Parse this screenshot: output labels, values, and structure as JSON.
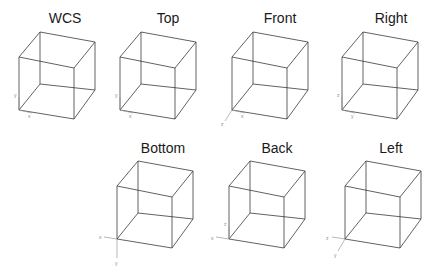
{
  "views": [
    {
      "id": "wcs",
      "label": "WCS",
      "label_x": 65,
      "label_y": 10,
      "origin": [
        19,
        110
      ],
      "dx": 0,
      "dy": 0,
      "axes": [
        {
          "name": "x",
          "to": [
            32,
            113
          ]
        },
        {
          "name": "y",
          "to": [
            19,
            97
          ]
        }
      ],
      "axis_labels": [
        {
          "t": "y",
          "x": 14,
          "y": 97
        },
        {
          "t": "x",
          "x": 28,
          "y": 118
        }
      ]
    },
    {
      "id": "top",
      "label": "Top",
      "label_x": 168,
      "label_y": 10,
      "origin": [
        120,
        110
      ],
      "dx": 101,
      "dy": 0,
      "axes": [
        {
          "name": "x",
          "to": [
            133,
            113
          ]
        },
        {
          "name": "y",
          "to": [
            120,
            97
          ]
        }
      ],
      "axis_labels": [
        {
          "t": "y",
          "x": 115,
          "y": 97
        },
        {
          "t": "x",
          "x": 129,
          "y": 118
        }
      ]
    },
    {
      "id": "front",
      "label": "Front",
      "label_x": 280,
      "label_y": 10,
      "origin": [
        232,
        110
      ],
      "dx": 213,
      "dy": 0,
      "axes": [
        {
          "name": "x",
          "to": [
            245,
            113
          ]
        },
        {
          "name": "z",
          "to": [
            225,
            121
          ]
        }
      ],
      "axis_labels": [
        {
          "t": "z",
          "x": 221,
          "y": 126
        },
        {
          "t": "x",
          "x": 241,
          "y": 118
        }
      ]
    },
    {
      "id": "right",
      "label": "Right",
      "label_x": 391,
      "label_y": 10,
      "origin": [
        342,
        110
      ],
      "dx": 323,
      "dy": 0,
      "axes": [
        {
          "name": "y",
          "to": [
            355,
            113
          ]
        },
        {
          "name": "z",
          "to": [
            342,
            97
          ]
        }
      ],
      "axis_labels": [
        {
          "t": "z",
          "x": 337,
          "y": 97
        },
        {
          "t": "y",
          "x": 351,
          "y": 118
        }
      ]
    },
    {
      "id": "bottom",
      "label": "Bottom",
      "label_x": 163,
      "label_y": 140,
      "origin": [
        117,
        239
      ],
      "dx": 98,
      "dy": 129,
      "axes": [
        {
          "name": "x",
          "to": [
            104,
            237
          ]
        },
        {
          "name": "y",
          "to": [
            117,
            258
          ]
        }
      ],
      "axis_labels": [
        {
          "t": "x",
          "x": 99,
          "y": 239
        },
        {
          "t": "y",
          "x": 115,
          "y": 265
        }
      ]
    },
    {
      "id": "back",
      "label": "Back",
      "label_x": 277,
      "label_y": 140,
      "origin": [
        229,
        239
      ],
      "dx": 210,
      "dy": 129,
      "axes": [
        {
          "name": "x",
          "to": [
            216,
            237
          ]
        },
        {
          "name": "z",
          "to": [
            229,
            226
          ]
        }
      ],
      "axis_labels": [
        {
          "t": "x",
          "x": 211,
          "y": 240
        },
        {
          "t": "z",
          "x": 224,
          "y": 226
        }
      ]
    },
    {
      "id": "left",
      "label": "Left",
      "label_x": 391,
      "label_y": 140,
      "origin": [
        345,
        239
      ],
      "dx": 326,
      "dy": 129,
      "axes": [
        {
          "name": "z",
          "to": [
            332,
            237
          ]
        },
        {
          "name": "y",
          "to": [
            338,
            251
          ]
        }
      ],
      "axis_labels": [
        {
          "t": "z",
          "x": 326,
          "y": 240
        },
        {
          "t": "y",
          "x": 334,
          "y": 257
        }
      ]
    }
  ],
  "cube_template": {
    "vertices": {
      "TBL": [
        40,
        32
      ],
      "TBR": [
        95,
        42
      ],
      "TFL": [
        19,
        57
      ],
      "TFR": [
        74,
        68
      ],
      "BBL": [
        40,
        84
      ],
      "BBR": [
        95,
        90
      ],
      "BFL": [
        19,
        110
      ],
      "BFR": [
        74,
        119
      ]
    },
    "edges": [
      [
        "TBL",
        "TBR"
      ],
      [
        "TBR",
        "TFR"
      ],
      [
        "TFR",
        "TFL"
      ],
      [
        "TFL",
        "TBL"
      ],
      [
        "BBL",
        "BBR"
      ],
      [
        "BBR",
        "BFR"
      ],
      [
        "BFR",
        "BFL"
      ],
      [
        "BFL",
        "BBL"
      ],
      [
        "TBL",
        "BBL"
      ],
      [
        "TBR",
        "BBR"
      ],
      [
        "TFL",
        "BFL"
      ],
      [
        "TFR",
        "BFR"
      ]
    ]
  }
}
